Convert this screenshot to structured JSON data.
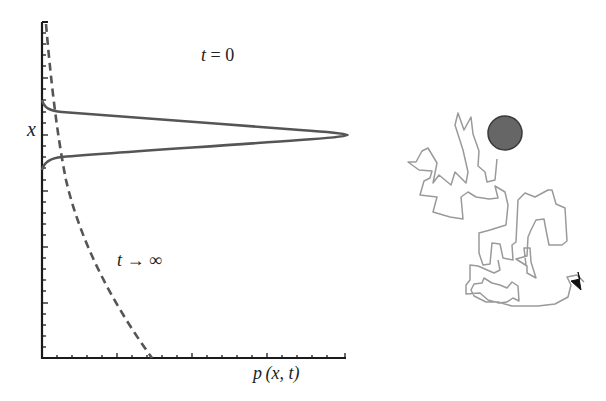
{
  "figure": {
    "left_panel": {
      "type": "probability-distribution-plot",
      "y_axis_label": "x",
      "x_axis_label": "p (x, t)",
      "curves": [
        {
          "name": "initial-distribution",
          "label": "t = 0",
          "style": "solid",
          "shape": "sharp peak centered on x"
        },
        {
          "name": "stationary-distribution",
          "label": "t → ∞",
          "style": "dashed",
          "shape": "decaying curve"
        }
      ]
    },
    "right_panel": {
      "type": "random-walk-trajectory",
      "description": "Brownian path starting at a filled circle ending with an arrowhead",
      "start_marker_color": "#6b6b6b",
      "path_color": "#9a9a9a",
      "arrow_color": "#111111"
    }
  },
  "labels": {
    "y_axis": "x",
    "x_axis_p": "p",
    "x_axis_args": "(x, t)",
    "t0_var": "t",
    "t0_rest": " = 0",
    "tinf_var": "t",
    "tinf_rest": " → ∞"
  },
  "colors": {
    "axis": "#1a1a1a",
    "curve": "#555555",
    "dashed": "#555555",
    "walk": "#9a9a9a",
    "circle": "#666666"
  }
}
